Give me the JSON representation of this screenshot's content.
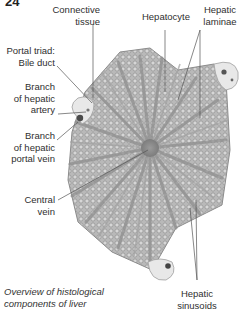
{
  "figure": {
    "number_partial": "24",
    "caption": [
      "Overview of histological",
      "components of liver"
    ]
  },
  "labels": {
    "connective_tissue": [
      "Connective",
      "tissue"
    ],
    "hepatocyte": "Hepatocyte",
    "hepatic_laminae": [
      "Hepatic",
      "laminae"
    ],
    "portal_triad_bile_duct": [
      "Portal triad:",
      "Bile duct"
    ],
    "branch_hepatic_artery": [
      "Branch",
      "of hepatic",
      "artery"
    ],
    "branch_hepatic_portal_vein": [
      "Branch",
      "of hepatic",
      "portal vein"
    ],
    "central_vein": [
      "Central",
      "vein"
    ],
    "hepatic_sinusoids": [
      "Hepatic",
      "sinusoids"
    ]
  },
  "colors": {
    "tissue": "#b8b8b8",
    "tissue_dark": "#8f8f8f",
    "sinusoid": "#9a9a9a",
    "portal": "#e6e6e6",
    "leader": "#555555"
  }
}
